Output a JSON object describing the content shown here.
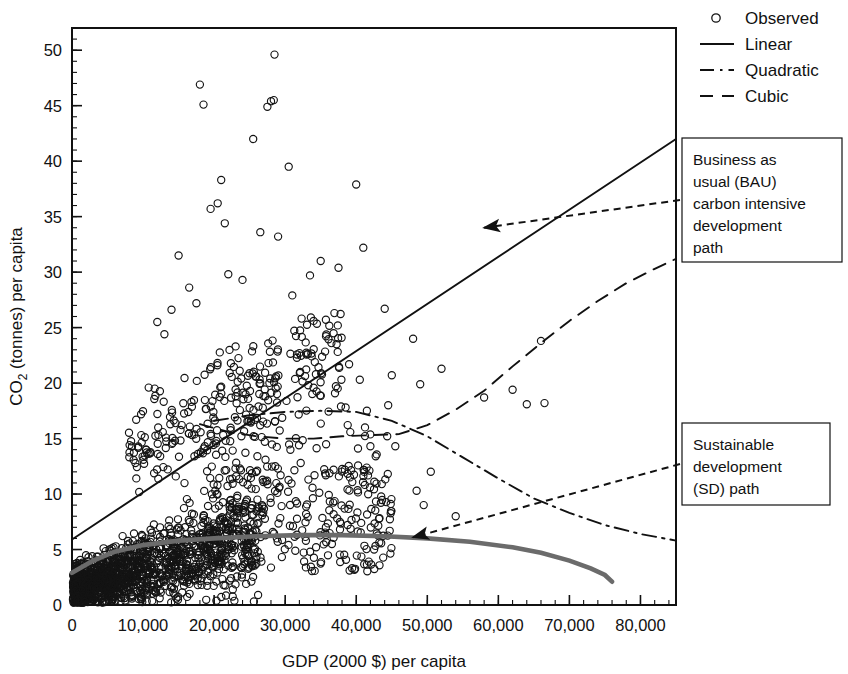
{
  "chart_data": {
    "type": "scatter",
    "title": "",
    "xlabel": "GDP (2000 $) per capita",
    "ylabel": "CO2 (tonnes) per capita",
    "ylabel_parts": {
      "base": "CO",
      "sub": "2",
      "rest": " (tonnes) per capita"
    },
    "xlim": [
      0,
      85000
    ],
    "ylim": [
      0,
      52
    ],
    "xticks": [
      0,
      10000,
      20000,
      30000,
      40000,
      50000,
      60000,
      70000,
      80000
    ],
    "xticklabels": [
      "0",
      "10,000",
      "20,000",
      "30,000",
      "40,000",
      "50,000",
      "60,000",
      "70,000",
      "80,000"
    ],
    "yticks": [
      0,
      5,
      10,
      15,
      20,
      25,
      30,
      35,
      40,
      45,
      50
    ],
    "yticklabels": [
      "0",
      "5",
      "10",
      "15",
      "20",
      "25",
      "30",
      "35",
      "40",
      "45",
      "50"
    ],
    "x_minor_interval": 2000,
    "y_minor_interval": 1,
    "grid": false,
    "legend_position": "top-right",
    "legend": [
      {
        "name": "Observed",
        "marker": "circle",
        "style": "none"
      },
      {
        "name": "Linear",
        "marker": "none",
        "style": "solid"
      },
      {
        "name": "Quadratic",
        "marker": "none",
        "style": "dashdot"
      },
      {
        "name": "Cubic",
        "marker": "none",
        "style": "dashed"
      }
    ],
    "series": [
      {
        "name": "Linear",
        "style": "solid",
        "color": "#111111",
        "points": [
          [
            0,
            5.9
          ],
          [
            85000,
            42.0
          ]
        ]
      },
      {
        "name": "Quadratic",
        "style": "dashdot",
        "color": "#111111",
        "points": [
          [
            20000,
            16.6
          ],
          [
            25000,
            17.1
          ],
          [
            30000,
            17.4
          ],
          [
            35000,
            17.5
          ],
          [
            40000,
            17.4
          ],
          [
            45000,
            16.6
          ],
          [
            50000,
            15.2
          ],
          [
            55000,
            13.3
          ],
          [
            60000,
            11.4
          ],
          [
            65000,
            9.6
          ],
          [
            70000,
            8.3
          ],
          [
            75000,
            7.2
          ],
          [
            80000,
            6.4
          ],
          [
            85000,
            5.8
          ]
        ]
      },
      {
        "name": "Cubic",
        "style": "dashed",
        "color": "#111111",
        "points": [
          [
            18000,
            16.3
          ],
          [
            22000,
            15.6
          ],
          [
            26000,
            15.2
          ],
          [
            30000,
            15.0
          ],
          [
            34000,
            15.0
          ],
          [
            38000,
            15.2
          ],
          [
            42000,
            15.3
          ],
          [
            46000,
            15.4
          ],
          [
            50000,
            16.2
          ],
          [
            54000,
            17.6
          ],
          [
            58000,
            19.3
          ],
          [
            62000,
            21.5
          ],
          [
            66000,
            23.6
          ],
          [
            70000,
            25.6
          ],
          [
            74000,
            27.4
          ],
          [
            78000,
            29.0
          ],
          [
            82000,
            30.3
          ],
          [
            85000,
            31.2
          ]
        ]
      },
      {
        "name": "Sustainable development (SD) path",
        "style": "thick-gray",
        "color": "#6b6b6b",
        "points": [
          [
            0,
            2.9
          ],
          [
            3000,
            4.0
          ],
          [
            6000,
            4.8
          ],
          [
            10000,
            5.4
          ],
          [
            15000,
            5.8
          ],
          [
            20000,
            6.0
          ],
          [
            26000,
            6.2
          ],
          [
            32000,
            6.3
          ],
          [
            38000,
            6.3
          ],
          [
            44000,
            6.2
          ],
          [
            50000,
            6.0
          ],
          [
            56000,
            5.7
          ],
          [
            62000,
            5.2
          ],
          [
            66000,
            4.7
          ],
          [
            70000,
            4.0
          ],
          [
            73000,
            3.3
          ],
          [
            75000,
            2.7
          ],
          [
            76000,
            2.1
          ]
        ]
      }
    ],
    "observed_note": "Dense cloud of open-circle observations, heaviest below 20,000 GDP and under 12 tonnes CO2, with scattered outliers up to ~50 tonnes near 28,000 GDP.",
    "annotations": [
      {
        "name": "bau",
        "lines": [
          "Business as",
          "usual (BAU)",
          "carbon intensive",
          "development",
          "path"
        ],
        "arrow_style": "dashed",
        "target": [
          58000,
          34.0
        ]
      },
      {
        "name": "sd",
        "lines": [
          "Sustainable",
          "development",
          "(SD) path"
        ],
        "arrow_style": "dashed",
        "target": [
          48000,
          6.1
        ]
      }
    ]
  },
  "colors": {
    "axis": "#111111",
    "marker": "#141414",
    "sd_curve": "#6b6b6b",
    "background": "#ffffff"
  }
}
